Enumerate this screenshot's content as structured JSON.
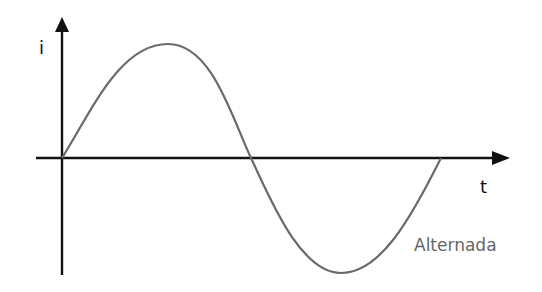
{
  "diagram": {
    "type": "alternating current waveform",
    "y_axis_label": "i",
    "x_axis_label": "t",
    "caption": "Alternada",
    "colors": {
      "axes": "#111111",
      "curve": "#6a6a6a",
      "caption": "#666666"
    }
  }
}
